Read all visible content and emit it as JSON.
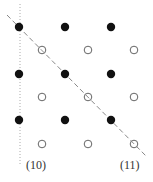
{
  "diagram": {
    "colors": {
      "filled_dot": "#111111",
      "open_dot_stroke": "#555555",
      "dashed_line": "#888888",
      "dotted_line": "#aaaaaa",
      "label": "#333333"
    },
    "filled_dots": [
      {
        "x": 19,
        "y": 27
      },
      {
        "x": 65,
        "y": 27
      },
      {
        "x": 111,
        "y": 27
      },
      {
        "x": 19,
        "y": 74
      },
      {
        "x": 65,
        "y": 74
      },
      {
        "x": 111,
        "y": 74
      },
      {
        "x": 19,
        "y": 120
      },
      {
        "x": 65,
        "y": 120
      },
      {
        "x": 111,
        "y": 120
      }
    ],
    "open_dots": [
      {
        "x": 42,
        "y": 50
      },
      {
        "x": 88,
        "y": 50
      },
      {
        "x": 134,
        "y": 50
      },
      {
        "x": 42,
        "y": 97
      },
      {
        "x": 88,
        "y": 97
      },
      {
        "x": 134,
        "y": 97
      },
      {
        "x": 42,
        "y": 144
      },
      {
        "x": 88,
        "y": 144
      },
      {
        "x": 134,
        "y": 144
      }
    ],
    "dashed_line": {
      "x1": 7,
      "y1": 15,
      "x2": 146,
      "y2": 156
    },
    "dotted_line": {
      "x1": 20,
      "y1": 4,
      "x2": 20,
      "y2": 165
    },
    "labels": [
      {
        "id": "label-10",
        "text": "(10)",
        "x": 26,
        "y": 169
      },
      {
        "id": "label-11",
        "text": "(11)",
        "x": 120,
        "y": 169
      }
    ]
  }
}
